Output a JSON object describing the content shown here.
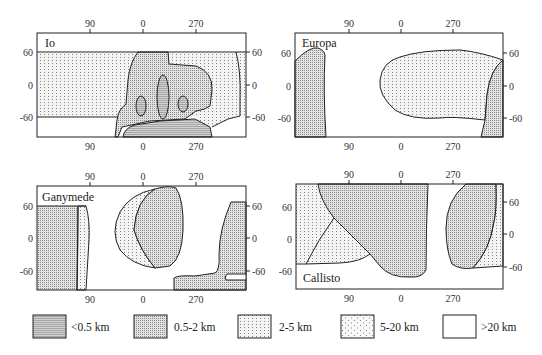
{
  "figure": {
    "panels": [
      {
        "id": "io",
        "title": "Io",
        "title_position": "top-left"
      },
      {
        "id": "europa",
        "title": "Europa",
        "title_position": "top-left"
      },
      {
        "id": "ganymede",
        "title": "Ganymede",
        "title_position": "top-left"
      },
      {
        "id": "callisto",
        "title": "Callisto",
        "title_position": "bottom-left"
      }
    ],
    "axes": {
      "longitude_ticks": [
        "90",
        "0",
        "270"
      ],
      "latitude_ticks": [
        "60",
        "0",
        "-60"
      ]
    },
    "legend": [
      {
        "label": "<0.5 km",
        "pattern": "dense-horizontal-hatch"
      },
      {
        "label": "0.5-2 km",
        "pattern": "dense-dots"
      },
      {
        "label": "2-5 km",
        "pattern": "medium-dots"
      },
      {
        "label": "5-20 km",
        "pattern": "sparse-dots"
      },
      {
        "label": ">20 km",
        "pattern": "blank"
      }
    ],
    "colors": {
      "line": "#222222",
      "fill_dense": "#cfcfcf",
      "fill_medium": "#e4e4e4",
      "fill_light": "#f2f2f2",
      "background": "#ffffff"
    }
  }
}
